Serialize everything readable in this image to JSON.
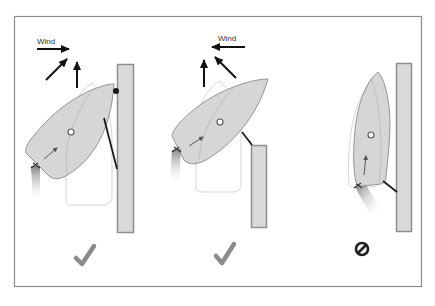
{
  "diagram": {
    "colors": {
      "frame_border": "#8c8c8c",
      "dock_fill": "#d9d9d9",
      "dock_stroke": "#8f8f8f",
      "hull_fill": "#d6d6d6",
      "hull_stroke": "#8a8a8a",
      "rope": "#1a1a1a",
      "check": "#8a8a8a",
      "forbid": "#1f1f1f"
    },
    "panels": [
      {
        "id": "panel-1",
        "wind_label": "Wind",
        "wind_direction": "right",
        "wind_arrows": [
          "right",
          "up-right",
          "up"
        ],
        "result_icon": "checkmark-icon",
        "result": "correct"
      },
      {
        "id": "panel-2",
        "wind_label": "Wind",
        "wind_direction": "left",
        "wind_arrows": [
          "left",
          "up-left",
          "up"
        ],
        "result_icon": "checkmark-icon",
        "result": "correct"
      },
      {
        "id": "panel-3",
        "wind_label": "",
        "wind_direction": "none",
        "wind_arrows": [],
        "result_icon": "prohibited-icon",
        "result": "incorrect"
      }
    ]
  }
}
